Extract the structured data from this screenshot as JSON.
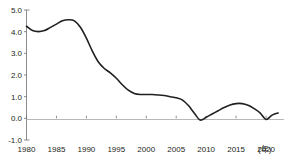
{
  "chart_data": {
    "type": "line",
    "title": "",
    "subtitle": "",
    "xlabel": "",
    "ylabel": "",
    "unit_label": "(年)",
    "xlim": [
      1980,
      2023
    ],
    "ylim": [
      -1.0,
      5.0
    ],
    "grid": false,
    "legend": false,
    "zero_line": true,
    "y_ticks": [
      "5.0",
      "4.0",
      "3.0",
      "2.0",
      "1.0",
      "0.0",
      "-1.0"
    ],
    "y_tick_values": [
      5.0,
      4.0,
      3.0,
      2.0,
      1.0,
      0.0,
      -1.0
    ],
    "x_ticks": [
      "1980",
      "1985",
      "1990",
      "1995",
      "2000",
      "2005",
      "2010",
      "2015",
      "2020"
    ],
    "x_tick_values": [
      1980,
      1985,
      1990,
      1995,
      2000,
      2005,
      2010,
      2015,
      2020
    ],
    "series": [
      {
        "name": "series-1",
        "color": "#231f20",
        "x": [
          1980,
          1981,
          1982,
          1983,
          1984,
          1985,
          1986,
          1987,
          1988,
          1989,
          1990,
          1991,
          1992,
          1993,
          1994,
          1995,
          1996,
          1997,
          1998,
          1999,
          2000,
          2001,
          2002,
          2003,
          2004,
          2005,
          2006,
          2007,
          2008,
          2009,
          2010,
          2011,
          2012,
          2013,
          2014,
          2015,
          2016,
          2017,
          2018,
          2019,
          2020,
          2021,
          2022
        ],
        "values": [
          4.25,
          4.05,
          4.0,
          4.05,
          4.2,
          4.35,
          4.5,
          4.55,
          4.5,
          4.2,
          3.7,
          3.1,
          2.6,
          2.3,
          2.1,
          1.85,
          1.55,
          1.3,
          1.15,
          1.1,
          1.1,
          1.1,
          1.08,
          1.05,
          1.0,
          0.95,
          0.85,
          0.6,
          0.25,
          -0.08,
          0.05,
          0.2,
          0.35,
          0.5,
          0.62,
          0.68,
          0.68,
          0.6,
          0.45,
          0.25,
          -0.05,
          0.15,
          0.25
        ]
      }
    ]
  }
}
